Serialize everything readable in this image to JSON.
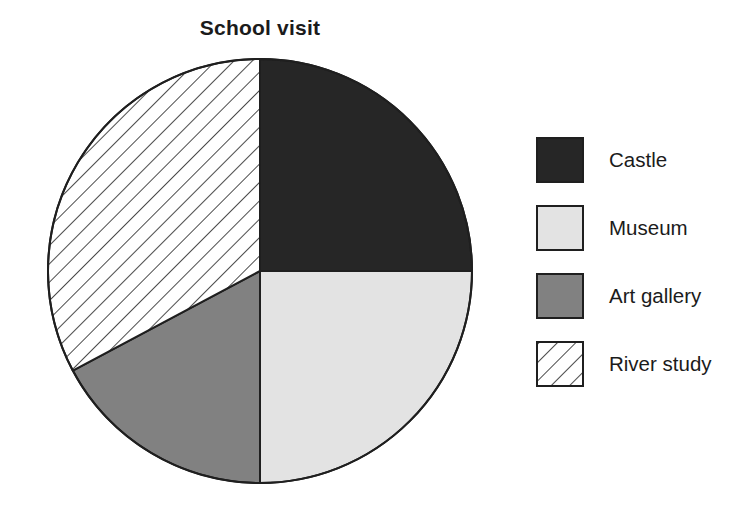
{
  "chart_data": {
    "type": "pie",
    "title": "School visit",
    "xlabel": "",
    "ylabel": "",
    "legend_position": "right",
    "grid": false,
    "categories": [
      "Castle",
      "Museum",
      "Art gallery",
      "River study"
    ],
    "values": [
      25,
      25,
      17,
      33
    ],
    "units": "percent",
    "start_angle_deg": 0,
    "direction": "clockwise",
    "slices": [
      {
        "label": "Castle",
        "value": 25,
        "percent": "25%",
        "start_angle_deg": 0,
        "end_angle_deg": 90,
        "fill": "#262626",
        "pattern": "solid",
        "swatch": "castle-swatch"
      },
      {
        "label": "Museum",
        "value": 25,
        "percent": "25%",
        "start_angle_deg": 90,
        "end_angle_deg": 180,
        "fill": "#e3e3e3",
        "pattern": "solid",
        "swatch": "museum-swatch"
      },
      {
        "label": "Art gallery",
        "value": 17,
        "percent": "17%",
        "start_angle_deg": 180,
        "end_angle_deg": 242,
        "fill": "#818181",
        "pattern": "solid",
        "swatch": "art-gallery-swatch"
      },
      {
        "label": "River study",
        "value": 33,
        "percent": "33%",
        "start_angle_deg": 242,
        "end_angle_deg": 360,
        "fill": "#ffffff",
        "pattern": "diagonal-hatch",
        "swatch": "river-study-swatch"
      }
    ]
  },
  "chart": {
    "title": "School visit",
    "center_x": 260,
    "center_y": 271,
    "radius": 212,
    "outline_color": "#1f1f1f"
  },
  "legend": {
    "items": [
      {
        "label": "Castle",
        "color": "#262626",
        "pattern": "solid"
      },
      {
        "label": "Museum",
        "color": "#e3e3e3",
        "pattern": "solid"
      },
      {
        "label": "Art gallery",
        "color": "#818181",
        "pattern": "solid"
      },
      {
        "label": "River study",
        "color": "#ffffff",
        "pattern": "diagonal-hatch"
      }
    ]
  }
}
